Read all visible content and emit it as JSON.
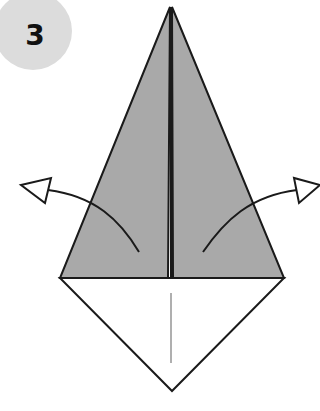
{
  "step": {
    "number": "3"
  },
  "colors": {
    "badge": "#dcdcdc",
    "flap_fill": "#a9a9a9",
    "line": "#1a1a1a",
    "paper": "#ffffff",
    "crease": "#7a7a7a"
  },
  "diagram": {
    "shape": "kite",
    "apex": [
      171,
      7
    ],
    "left_corner": [
      60,
      278
    ],
    "right_corner": [
      284,
      278
    ],
    "bottom": [
      172,
      391
    ],
    "flaps": [
      "left-flap",
      "right-flap"
    ],
    "arrows": [
      "unfold-left-arrow",
      "unfold-right-arrow"
    ],
    "crease_line": "center-vertical"
  }
}
